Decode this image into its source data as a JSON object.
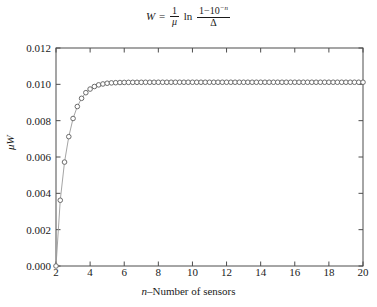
{
  "chart_data": {
    "type": "line",
    "title_parts": {
      "lhs": "W",
      "equals": "=",
      "frac1_num": "1",
      "frac1_den": "μ",
      "ln": "ln",
      "frac2_num_base": "1−10",
      "frac2_num_sup": "−n",
      "frac2_den": "Δ"
    },
    "xlabel": "n–Number of sensors",
    "xlabel_parts": {
      "italic": "n",
      "rest": "–Number of sensors"
    },
    "ylabel": "μW",
    "ylabel_parts": {
      "italic": "μ",
      "rest": "W"
    },
    "xlim": [
      2,
      20
    ],
    "ylim": [
      0.0,
      0.012
    ],
    "xticks": [
      2,
      4,
      6,
      8,
      10,
      12,
      14,
      16,
      18,
      20
    ],
    "xtick_labels": [
      "2",
      "4",
      "6",
      "8",
      "10",
      "12",
      "14",
      "16",
      "18",
      "20"
    ],
    "yticks": [
      0.0,
      0.002,
      0.004,
      0.006,
      0.008,
      0.01,
      0.012
    ],
    "ytick_labels": [
      "0.000",
      "0.002",
      "0.004",
      "0.006",
      "0.008",
      "0.010",
      "0.012"
    ],
    "grid": false,
    "legend": null,
    "frame": "box",
    "tick_direction": "in",
    "marker": "open-circle",
    "marker_color": "#6b6b6b",
    "line_color": "#9a9a9a",
    "axis_color": "#4d4d4d",
    "x": [
      2,
      2.25,
      2.5,
      2.75,
      3,
      3.25,
      3.5,
      3.75,
      4,
      4.25,
      4.5,
      4.75,
      5,
      5.25,
      5.5,
      5.75,
      6,
      6.25,
      6.5,
      6.75,
      7,
      7.25,
      7.5,
      7.75,
      8,
      8.25,
      8.5,
      8.75,
      9,
      9.25,
      9.5,
      9.75,
      10,
      10.25,
      10.5,
      10.75,
      11,
      11.25,
      11.5,
      11.75,
      12,
      12.25,
      12.5,
      12.75,
      13,
      13.25,
      13.5,
      13.75,
      14,
      14.25,
      14.5,
      14.75,
      15,
      15.25,
      15.5,
      15.75,
      16,
      16.25,
      16.5,
      16.75,
      17,
      17.25,
      17.5,
      17.75,
      18,
      18.25,
      18.5,
      18.75,
      19,
      19.25,
      19.5,
      19.75,
      20
    ],
    "y": [
      0.0,
      0.00362,
      0.00572,
      0.00712,
      0.00812,
      0.00878,
      0.00923,
      0.00954,
      0.00974,
      0.00988,
      0.00997,
      0.01002,
      0.01006,
      0.01008,
      0.01009,
      0.0101,
      0.010105,
      0.010108,
      0.01011,
      0.010111,
      0.010112,
      0.010113,
      0.010113,
      0.010114,
      0.010114,
      0.010114,
      0.010114,
      0.010115,
      0.010115,
      0.010115,
      0.010115,
      0.010115,
      0.010115,
      0.010115,
      0.010115,
      0.010115,
      0.010115,
      0.010115,
      0.010115,
      0.010115,
      0.010115,
      0.010115,
      0.010115,
      0.010115,
      0.010115,
      0.010115,
      0.010115,
      0.010115,
      0.010115,
      0.010115,
      0.010115,
      0.010115,
      0.010115,
      0.010115,
      0.010115,
      0.010115,
      0.010115,
      0.010115,
      0.010115,
      0.010115,
      0.010115,
      0.010115,
      0.010115,
      0.010115,
      0.010115,
      0.010115,
      0.010115,
      0.010115,
      0.010115,
      0.010115,
      0.010115,
      0.010115,
      0.010115
    ]
  }
}
